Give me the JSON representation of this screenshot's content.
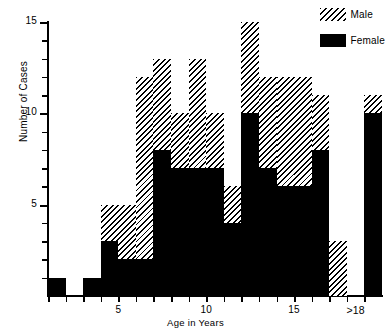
{
  "chart_data": {
    "type": "bar",
    "subtype": "stacked-histogram",
    "title": "",
    "xlabel": "Age in Years",
    "ylabel": "Number of Cases",
    "ylim": [
      0,
      15
    ],
    "yticks": [
      0,
      1,
      2,
      3,
      4,
      5,
      6,
      7,
      8,
      9,
      10,
      11,
      12,
      13,
      14,
      15
    ],
    "ytick_labels": [
      "5",
      "10",
      "15"
    ],
    "ytick_label_values": [
      5,
      10,
      15
    ],
    "xlim": [
      1,
      19
    ],
    "xticks": [
      1,
      2,
      3,
      4,
      5,
      6,
      7,
      8,
      9,
      10,
      11,
      12,
      13,
      14,
      15,
      16,
      17,
      18,
      19
    ],
    "xtick_labels": [
      "5",
      "10",
      "15",
      ">18"
    ],
    "xtick_label_values": [
      5,
      10,
      15,
      18.5
    ],
    "grid": false,
    "legend_position": "top-right",
    "categories": [
      "1",
      "2",
      "3",
      "4",
      "5",
      "6",
      "7",
      "8",
      "9",
      "10",
      "11",
      "12",
      "13",
      "14",
      "15",
      "16",
      "17",
      "18",
      ">18"
    ],
    "series": [
      {
        "name": "Female",
        "pattern": "solid-black",
        "color": "#000000",
        "values": [
          1,
          0,
          1,
          3,
          2,
          2,
          8,
          7,
          7,
          7,
          4,
          10,
          7,
          6,
          6,
          8,
          0,
          0,
          10
        ]
      },
      {
        "name": "Male",
        "pattern": "diagonal-hatch",
        "color": "#000000",
        "values": [
          0,
          0,
          0,
          2,
          3,
          10,
          5,
          3,
          6,
          3,
          2,
          5,
          5,
          6,
          6,
          3,
          3,
          0,
          1
        ]
      }
    ],
    "totals": [
      1,
      0,
      1,
      5,
      5,
      12,
      13,
      10,
      13,
      10,
      6,
      15,
      12,
      12,
      12,
      11,
      3,
      0,
      11
    ],
    "legend": [
      {
        "label": "Male",
        "swatch": "hatch"
      },
      {
        "label": "Female",
        "swatch": "solid"
      }
    ]
  }
}
